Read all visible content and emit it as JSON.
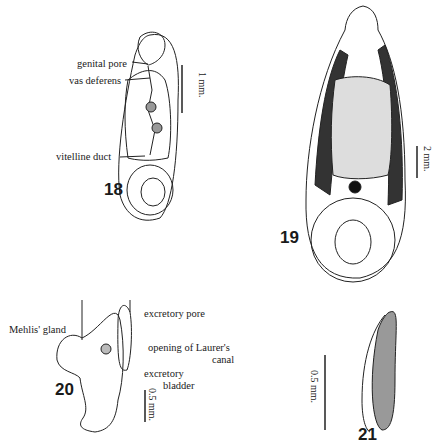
{
  "figures": [
    {
      "number": "18",
      "labels": [
        "genital pore",
        "vas deferens",
        "vitelline duct"
      ],
      "scale": "1 mm."
    },
    {
      "number": "19",
      "labels": [],
      "scale": "2 mm."
    },
    {
      "number": "20",
      "labels": [
        "Mehlis' gland",
        "excretory pore",
        "opening of Laurer's",
        "canal",
        "excretory",
        "bladder"
      ],
      "scale": "0.5 mm."
    },
    {
      "number": "21",
      "labels": [],
      "scale": "0.5 mm."
    }
  ]
}
